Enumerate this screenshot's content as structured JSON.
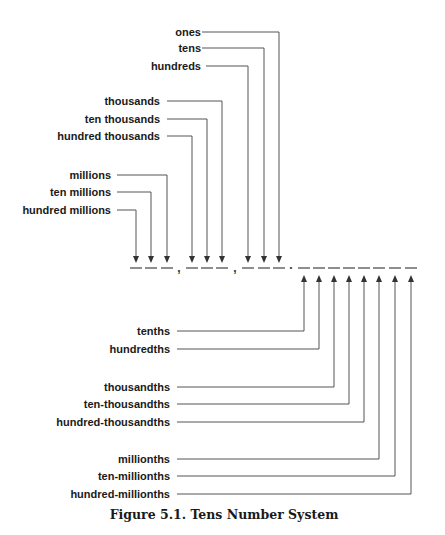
{
  "figure": {
    "caption": "Figure 5.1.  Tens Number System",
    "digit_row_y": 268,
    "separators": [
      {
        "char": ",",
        "x": 179
      },
      {
        "char": ",",
        "x": 235
      },
      {
        "char": ".",
        "x": 291
      }
    ],
    "whole_places": [
      {
        "label": "ones",
        "label_y": 32,
        "text_end_x": 201,
        "line_start_x": 202,
        "slot_x": 279
      },
      {
        "label": "tens",
        "label_y": 48,
        "text_end_x": 201,
        "line_start_x": 202,
        "slot_x": 264
      },
      {
        "label": "hundreds",
        "label_y": 66,
        "text_end_x": 201,
        "line_start_x": 206,
        "slot_x": 248
      },
      {
        "label": "thousands",
        "label_y": 101,
        "text_end_x": 160,
        "line_start_x": 167,
        "slot_x": 222
      },
      {
        "label": "ten thousands",
        "label_y": 119,
        "text_end_x": 160,
        "line_start_x": 167,
        "slot_x": 207
      },
      {
        "label": "hundred thousands",
        "label_y": 136,
        "text_end_x": 160,
        "line_start_x": 167,
        "slot_x": 192
      },
      {
        "label": "millions",
        "label_y": 175,
        "text_end_x": 111,
        "line_start_x": 117,
        "slot_x": 167
      },
      {
        "label": "ten millions",
        "label_y": 192,
        "text_end_x": 111,
        "line_start_x": 117,
        "slot_x": 151
      },
      {
        "label": "hundred millions",
        "label_y": 210,
        "text_end_x": 111,
        "line_start_x": 117,
        "slot_x": 136
      }
    ],
    "decimal_places": [
      {
        "label": "tenths",
        "label_y": 331,
        "text_end_x": 170,
        "line_start_x": 177,
        "slot_x": 304
      },
      {
        "label": "hundredths",
        "label_y": 349,
        "text_end_x": 170,
        "line_start_x": 177,
        "slot_x": 319
      },
      {
        "label": "thousandths",
        "label_y": 387,
        "text_end_x": 170,
        "line_start_x": 177,
        "slot_x": 334
      },
      {
        "label": "ten-thousandths",
        "label_y": 404,
        "text_end_x": 170,
        "line_start_x": 177,
        "slot_x": 349
      },
      {
        "label": "hundred-thousandths",
        "label_y": 422,
        "text_end_x": 170,
        "line_start_x": 177,
        "slot_x": 364
      },
      {
        "label": "millionths",
        "label_y": 459,
        "text_end_x": 170,
        "line_start_x": 177,
        "slot_x": 379
      },
      {
        "label": "ten-millionths",
        "label_y": 476,
        "text_end_x": 170,
        "line_start_x": 177,
        "slot_x": 395
      },
      {
        "label": "hundred-millionths",
        "label_y": 494,
        "text_end_x": 170,
        "line_start_x": 177,
        "slot_x": 411
      }
    ]
  }
}
